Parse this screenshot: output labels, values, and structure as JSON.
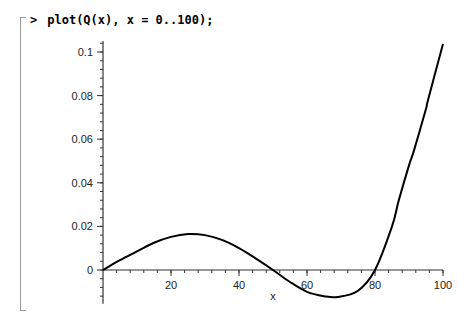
{
  "worksheet": {
    "prompt_symbol": ">",
    "command": "plot(Q(x), x = 0..100);"
  },
  "chart_data": {
    "type": "line",
    "title": "",
    "xlabel": "x",
    "ylabel": "",
    "xlim": [
      0,
      100
    ],
    "ylim": [
      -0.015,
      0.105
    ],
    "grid": false,
    "legend": null,
    "x_ticks": [
      20,
      40,
      60,
      80,
      100
    ],
    "y_ticks": [
      0,
      0.02,
      0.04,
      0.06,
      0.08,
      0.1
    ],
    "x_tick_labels": [
      "20",
      "40",
      "60",
      "80",
      "100"
    ],
    "y_tick_labels": [
      "0",
      "0.02",
      "0.04",
      "0.06",
      "0.08",
      "0.1"
    ],
    "series": [
      {
        "name": "Q(x)",
        "x": [
          0,
          5,
          10,
          15,
          20,
          25,
          30,
          35,
          40,
          45,
          50,
          55,
          60,
          65,
          69,
          75,
          80,
          85,
          87,
          90,
          91.5,
          95,
          95.6,
          100
        ],
        "values": [
          0,
          0.0045,
          0.0085,
          0.0125,
          0.0152,
          0.0165,
          0.016,
          0.0138,
          0.01,
          0.0052,
          0,
          -0.0055,
          -0.01,
          -0.012,
          -0.0124,
          -0.0095,
          0,
          0.02,
          0.032,
          0.048,
          0.055,
          0.074,
          0.078,
          0.1037
        ]
      }
    ]
  }
}
